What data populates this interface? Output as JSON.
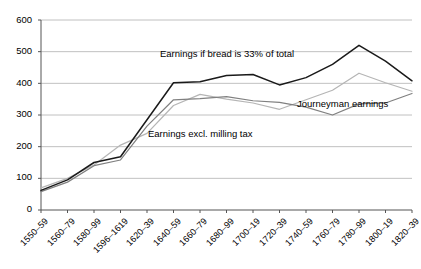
{
  "chart_data": {
    "type": "line",
    "title": "",
    "xlabel": "",
    "ylabel": "",
    "ylim": [
      0,
      600
    ],
    "ytick_step": 100,
    "grid": true,
    "legend": "inline-annotations",
    "categories": [
      "1550–59",
      "1560–79",
      "1580–99",
      "1596–1619",
      "1620–39",
      "1640–59",
      "1660–79",
      "1680–99",
      "1700–19",
      "1720–39",
      "1740–59",
      "1760–79",
      "1780–99",
      "1800–19",
      "1820–39"
    ],
    "yticks": [
      "0",
      "100",
      "200",
      "300",
      "400",
      "500",
      "600"
    ],
    "series": [
      {
        "name": "Earnings if bread is 33% of total",
        "color": "#1a1a1a",
        "values": [
          62,
          95,
          150,
          168,
          285,
          402,
          405,
          425,
          428,
          395,
          418,
          460,
          520,
          470,
          408
        ]
      },
      {
        "name": "Earnings excl. milling tax",
        "color": "#808080",
        "values": [
          58,
          88,
          140,
          158,
          265,
          348,
          352,
          358,
          345,
          340,
          325,
          300,
          335,
          338,
          368
        ]
      },
      {
        "name": "Journeyman earnings",
        "color": "#b5b5b5",
        "values": [
          70,
          100,
          142,
          205,
          242,
          330,
          365,
          350,
          338,
          318,
          348,
          378,
          432,
          402,
          375
        ]
      }
    ],
    "annotations": [
      {
        "text": "Earnings if bread is 33% of total",
        "x": 160,
        "y": 48
      },
      {
        "text": "Earnings excl. milling tax",
        "x": 148,
        "y": 128
      },
      {
        "text": "Journeyman earnings",
        "x": 297,
        "y": 98
      }
    ]
  }
}
